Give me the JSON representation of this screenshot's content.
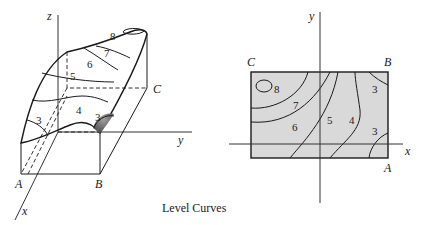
{
  "caption": "Level Curves",
  "colors": {
    "ink": "#1a1a1a",
    "surface_shade_light": "#f2f2f2",
    "surface_shade_dark": "#8a8a8a",
    "region_fill": "#d9d9d9"
  },
  "surface_3d": {
    "axis_labels": {
      "z": "z",
      "y": "y",
      "x": "x"
    },
    "corner_labels": {
      "A": "A",
      "B": "B",
      "C": "C"
    },
    "level_labels": [
      "8",
      "7",
      "6",
      "5",
      "4",
      "3",
      "3"
    ]
  },
  "contour_map": {
    "axis_labels": {
      "y": "y",
      "x": "x"
    },
    "corner_labels": {
      "C": "C",
      "B": "B",
      "A": "A"
    },
    "level_labels": [
      "8",
      "7",
      "6",
      "5",
      "4",
      "3",
      "3"
    ]
  }
}
